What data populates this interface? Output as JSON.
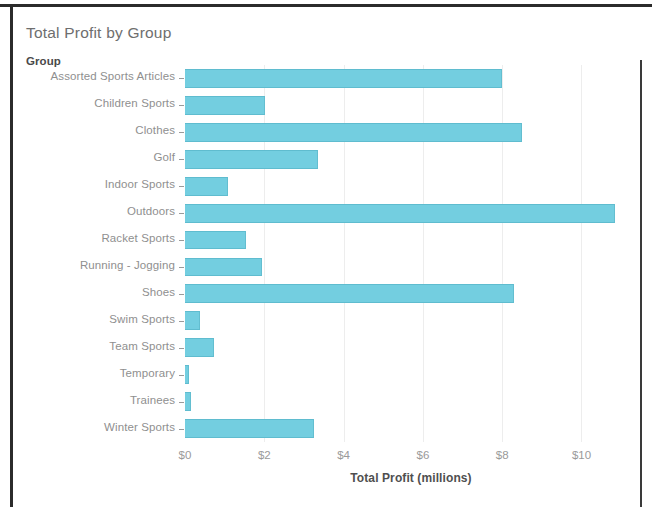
{
  "chart_data": {
    "type": "bar",
    "orientation": "horizontal",
    "title": "Total Profit by Group",
    "category_axis_label": "Group",
    "xlabel": "Total Profit (millions)",
    "ylabel": "Group",
    "xlim": [
      0,
      11.4
    ],
    "xticks": [
      0,
      2,
      4,
      6,
      8,
      10
    ],
    "xtick_labels": [
      "$0",
      "$2",
      "$4",
      "$6",
      "$8",
      "$10"
    ],
    "grid": "vertical",
    "legend": "none",
    "bar_color": "#73cee0",
    "bar_edge_color": "#5fbccf",
    "categories": [
      "Assorted Sports Articles",
      "Children Sports",
      "Clothes",
      "Golf",
      "Indoor Sports",
      "Outdoors",
      "Racket Sports",
      "Running - Jogging",
      "Shoes",
      "Swim Sports",
      "Team Sports",
      "Temporary",
      "Trainees",
      "Winter Sports"
    ],
    "values": [
      8.0,
      2.03,
      8.5,
      3.35,
      1.08,
      10.85,
      1.55,
      1.95,
      8.3,
      0.38,
      0.72,
      0.1,
      0.14,
      3.25
    ],
    "units": "millions of dollars"
  },
  "colors": {
    "bar_fill": "#73cee0",
    "bar_edge": "#5fbccf",
    "title_text": "#6e6e6e",
    "tick_text": "#9a9a9a",
    "grid": "#ededed",
    "frame": "#2b2b2b"
  }
}
